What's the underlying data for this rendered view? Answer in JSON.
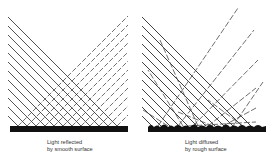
{
  "figure": {
    "panels": [
      {
        "id": "smooth",
        "caption_line1": "Light reflected",
        "caption_line2": "by smooth surface",
        "surface": "smooth"
      },
      {
        "id": "rough",
        "caption_line1": "Light diffused",
        "caption_line2": "by rough surface",
        "surface": "rough"
      }
    ],
    "colors": {
      "incident_line": "#2a2a2a",
      "reflected_line": "#4a4a4a",
      "surface": "#111111",
      "background": "#ffffff"
    }
  }
}
